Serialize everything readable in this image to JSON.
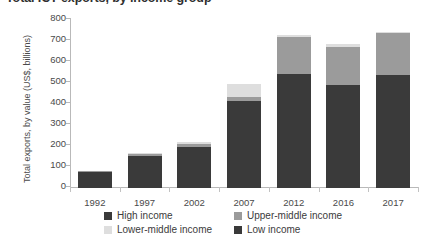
{
  "title": "Total ICT exports, by income group",
  "axes": {
    "ylabel": "Total exports, by value (US$, billions)",
    "xlabel": "",
    "yticks": [
      "0",
      "100",
      "200",
      "300",
      "400",
      "500",
      "600",
      "700",
      "800"
    ],
    "xticks": [
      "1992",
      "1997",
      "2002",
      "2007",
      "2012",
      "2016",
      "2017"
    ]
  },
  "legend": {
    "items": [
      {
        "label": "High income",
        "color": "#3a3a3a"
      },
      {
        "label": "Upper-middle income",
        "color": "#9b9b9b"
      },
      {
        "label": "Lower-middle income",
        "color": "#dedede"
      },
      {
        "label": "Low income",
        "color": "#3a3a3a"
      }
    ]
  },
  "chart_data": {
    "type": "bar",
    "stacked": true,
    "title": "Total ICT exports, by income group",
    "xlabel": "",
    "ylabel": "Total exports, by value (US$, billions)",
    "ylim": [
      0,
      800
    ],
    "ytick_step": 100,
    "grid": false,
    "legend_position": "bottom",
    "categories": [
      "1992",
      "1997",
      "2002",
      "2007",
      "2012",
      "2016",
      "2017"
    ],
    "series": [
      {
        "name": "High income",
        "color": "#3a3a3a",
        "values": [
          78,
          152,
          193,
          415,
          545,
          490,
          540
        ]
      },
      {
        "name": "Upper-middle income",
        "color": "#9b9b9b",
        "values": [
          2,
          8,
          18,
          18,
          172,
          180,
          198
        ]
      },
      {
        "name": "Lower-middle income",
        "color": "#dedede",
        "values": [
          0,
          5,
          7,
          62,
          12,
          18,
          4
        ]
      },
      {
        "name": "Low income",
        "color": "#3a3a3a",
        "values": [
          0,
          0,
          0,
          0,
          0,
          0,
          0
        ]
      }
    ],
    "totals": [
      80,
      165,
      218,
      495,
      729,
      688,
      742
    ]
  },
  "colors": {
    "axis": "#b9b9b9",
    "text": "#4a4a4a",
    "background": "#ffffff"
  }
}
